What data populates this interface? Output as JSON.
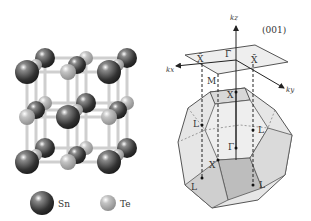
{
  "figure": {
    "left_panel": {
      "title": "SnTe rock-salt crystal structure",
      "legend": [
        {
          "label": "Sn",
          "color": "#3a3a3a"
        },
        {
          "label": "Te",
          "color": "#a8a8a8"
        }
      ]
    },
    "right_panel": {
      "title": "Brillouin zone",
      "surface_label": "(001)",
      "axes": {
        "kz": "kz",
        "kx": "kx",
        "ky": "ky"
      },
      "surface_points": {
        "gamma_bar": "Γ̄",
        "x_bar_left": "X̄",
        "x_bar_right": "X̄"
      },
      "bulk_points": {
        "M": "M",
        "X_top": "X",
        "Gamma": "Γ",
        "X_bottom": "X",
        "L": [
          "L",
          "L",
          "L",
          "L"
        ]
      }
    }
  }
}
